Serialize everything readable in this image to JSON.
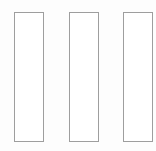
{
  "canvas": {
    "name": "three-vertical-panels",
    "width": 156,
    "height": 151,
    "background_color": "#fdfdfd"
  },
  "style": {
    "border_color": "#9e9e9e",
    "border_width_px": 1,
    "fill_color": "#ffffff"
  },
  "panels": [
    {
      "id": "panel-1",
      "label": "",
      "x": 14,
      "y": 12,
      "width": 30,
      "height": 130,
      "content": ""
    },
    {
      "id": "panel-2",
      "label": "",
      "x": 69,
      "y": 12,
      "width": 30,
      "height": 130,
      "content": ""
    },
    {
      "id": "panel-3",
      "label": "",
      "x": 123,
      "y": 12,
      "width": 30,
      "height": 130,
      "content": ""
    }
  ]
}
